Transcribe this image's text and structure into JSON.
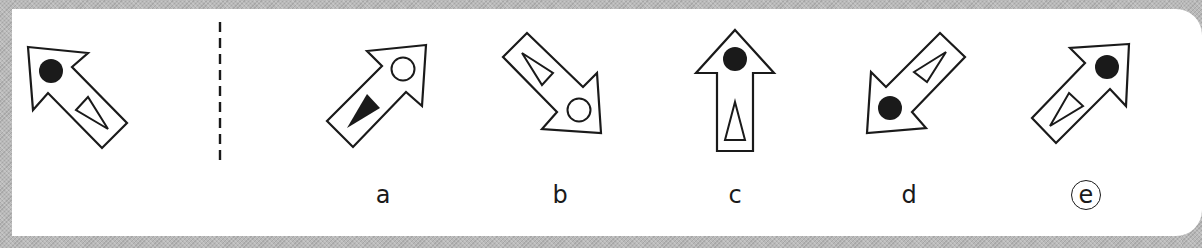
{
  "puzzle": {
    "description": "Odd-one-out / rotation matching puzzle: question arrow on the left, answer choices a–e on the right",
    "question": {
      "shape": "arrow",
      "direction": "up-left",
      "circle": "filled",
      "triangle": "hollow"
    },
    "options": [
      {
        "label": "a",
        "direction": "up-right",
        "circle": "hollow",
        "triangle": "filled",
        "selected": false
      },
      {
        "label": "b",
        "direction": "down-right",
        "circle": "hollow",
        "triangle": "hollow",
        "selected": false
      },
      {
        "label": "c",
        "direction": "up",
        "circle": "filled",
        "triangle": "hollow",
        "selected": false
      },
      {
        "label": "d",
        "direction": "down-left",
        "circle": "filled",
        "triangle": "hollow",
        "selected": false
      },
      {
        "label": "e",
        "direction": "up-right",
        "circle": "filled",
        "triangle": "hollow",
        "selected": true
      }
    ],
    "selected_answer": "e",
    "divider": "dashed-vertical"
  },
  "colors": {
    "background": "#b9b9b9",
    "panel": "#ffffff",
    "ink": "#1a1a1a"
  }
}
